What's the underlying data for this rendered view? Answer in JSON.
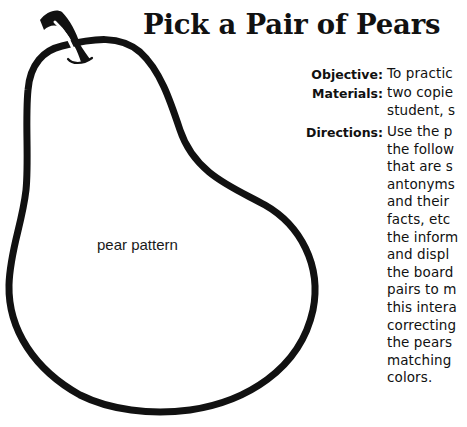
{
  "title": "Pick a Pair of Pears",
  "pear": {
    "label": "pear pattern",
    "outline_color": "#111111"
  },
  "info": {
    "objective": {
      "term": "Objective:",
      "lines": [
        "To practic"
      ]
    },
    "materials": {
      "term": "Materials:",
      "lines": [
        "two copie",
        "student, s"
      ]
    },
    "directions": {
      "term": "Directions:",
      "lines": [
        "Use the p",
        "the follow",
        "that are s",
        "antonyms",
        "and their",
        "facts, etc",
        "the inform",
        "and displ",
        "the board",
        "pairs to m",
        "this intera",
        "correcting",
        "the pears",
        "matching",
        "colors."
      ]
    }
  }
}
